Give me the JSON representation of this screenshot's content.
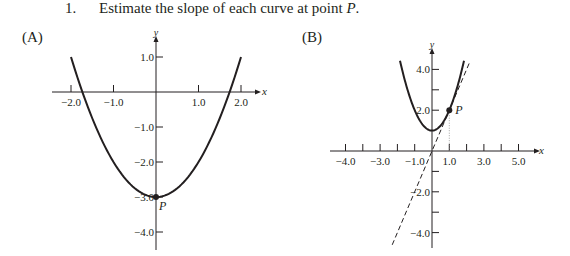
{
  "question": {
    "number": "1.",
    "text": "Estimate the slope of each curve at point ",
    "point_name": "P",
    "end": "."
  },
  "chart_data": [
    {
      "id": "A",
      "type": "line",
      "panel_label": "(A)",
      "title": "",
      "xlabel": "x",
      "ylabel": "y",
      "xlim": [
        -2.0,
        2.0
      ],
      "ylim": [
        -4.4,
        1.4
      ],
      "x_ticks": [
        -2.0,
        -1.0,
        1.0,
        2.0
      ],
      "x_tick_labels": [
        "−2.0",
        "−1.0",
        "1.0",
        "2.0"
      ],
      "y_ticks": [
        1.0,
        -1.0,
        -2.0,
        -3.0,
        -4.0
      ],
      "y_tick_labels": [
        "1.0",
        "−1.0",
        "−2.0",
        "−3.0",
        "−4.0"
      ],
      "curve": {
        "equation": "y = x^2 - 3",
        "x_range": [
          -2.0,
          2.0
        ]
      },
      "point": {
        "label": "P",
        "x": 0,
        "y": -3
      },
      "grid": false
    },
    {
      "id": "B",
      "type": "line",
      "panel_label": "(B)",
      "title": "",
      "xlabel": "x",
      "ylabel": "y",
      "xlim": [
        -5.0,
        5.0
      ],
      "ylim": [
        -4.8,
        4.8
      ],
      "x_ticks": [
        -5.0,
        -4.0,
        -3.0,
        -2.0,
        -1.0,
        1.0,
        2.0,
        3.0,
        4.0,
        5.0
      ],
      "x_tick_labels": [
        {
          "at": -5.0,
          "text": "−4.0"
        },
        {
          "at": -3.0,
          "text": "−3.0"
        },
        {
          "at": -1.0,
          "text": "−1.0"
        },
        {
          "at": 1.0,
          "text": "1.0"
        },
        {
          "at": 3.0,
          "text": "3.0"
        },
        {
          "at": 5.0,
          "text": "5.0"
        }
      ],
      "y_ticks": [
        4.0,
        3.0,
        2.0,
        -1.0,
        -2.0,
        -3.0,
        -4.0
      ],
      "y_tick_labels": [
        {
          "at": 4.0,
          "text": "4.0"
        },
        {
          "at": 2.0,
          "text": "2.0"
        },
        {
          "at": -2.0,
          "text": "−2.0"
        },
        {
          "at": -4.0,
          "text": "−4.0"
        }
      ],
      "curve": {
        "equation": "y = x^2 + 1",
        "x_range": [
          -1.85,
          1.85
        ]
      },
      "tangent": {
        "equation": "y = 2x",
        "x_range": [
          -2.3,
          2.2
        ],
        "style": "dashed"
      },
      "point": {
        "label": "P",
        "x": 1,
        "y": 2
      },
      "dropline": {
        "x": 1,
        "style": "dotted"
      },
      "grid": false
    }
  ]
}
